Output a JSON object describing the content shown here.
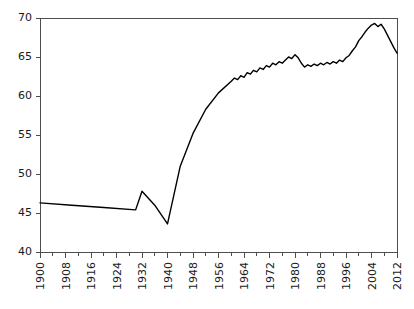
{
  "chart_data": {
    "type": "line",
    "title": "",
    "subtitle": "",
    "xlabel": "",
    "ylabel": "",
    "xlim": [
      1900,
      2012
    ],
    "ylim": [
      40,
      70
    ],
    "grid": false,
    "legend": null,
    "legend_position": "none",
    "line_color": "#000000",
    "axis_color": "#4d4d4d",
    "background_color": "#ffffff",
    "y_ticks": [
      40,
      45,
      50,
      55,
      60,
      65,
      70
    ],
    "y_tick_labels": [
      "40",
      "45",
      "50",
      "55",
      "60",
      "65",
      "70"
    ],
    "x_ticks": [
      1900,
      1908,
      1916,
      1924,
      1932,
      1940,
      1948,
      1956,
      1964,
      1972,
      1980,
      1988,
      1996,
      2004,
      2012
    ],
    "x_tick_labels": [
      "1900",
      "1908",
      "1916",
      "1924",
      "1932",
      "1940",
      "1948",
      "1956",
      "1964",
      "1972",
      "1980",
      "1988",
      "1996",
      "2004",
      "2012"
    ],
    "x_minor_tick_interval": 4,
    "x_tick_label_rotation": -90,
    "series": [
      {
        "name": "series-1",
        "x": [
          1900,
          1910,
          1920,
          1930,
          1932,
          1936,
          1940,
          1944,
          1948,
          1952,
          1956,
          1960,
          1961,
          1962,
          1963,
          1964,
          1965,
          1966,
          1967,
          1968,
          1969,
          1970,
          1971,
          1972,
          1973,
          1974,
          1975,
          1976,
          1977,
          1978,
          1979,
          1980,
          1981,
          1982,
          1983,
          1984,
          1985,
          1986,
          1987,
          1988,
          1989,
          1990,
          1991,
          1992,
          1993,
          1994,
          1995,
          1996,
          1997,
          1998,
          1999,
          2000,
          2001,
          2002,
          2003,
          2004,
          2005,
          2006,
          2007,
          2008,
          2009,
          2010,
          2011,
          2012
        ],
        "y": [
          46.3,
          46.0,
          45.7,
          45.4,
          47.8,
          46.0,
          43.6,
          51.0,
          55.2,
          58.3,
          60.4,
          61.9,
          62.3,
          62.1,
          62.6,
          62.4,
          63.0,
          62.8,
          63.3,
          63.1,
          63.6,
          63.4,
          63.9,
          63.7,
          64.2,
          64.0,
          64.4,
          64.2,
          64.6,
          65.0,
          64.8,
          65.3,
          64.9,
          64.2,
          63.7,
          64.0,
          63.8,
          64.1,
          63.9,
          64.2,
          64.0,
          64.3,
          64.1,
          64.4,
          64.2,
          64.6,
          64.4,
          64.9,
          65.2,
          65.8,
          66.3,
          67.1,
          67.6,
          68.2,
          68.7,
          69.1,
          69.3,
          68.9,
          69.2,
          68.6,
          67.8,
          67.0,
          66.2,
          65.5
        ]
      }
    ],
    "annotations": []
  }
}
